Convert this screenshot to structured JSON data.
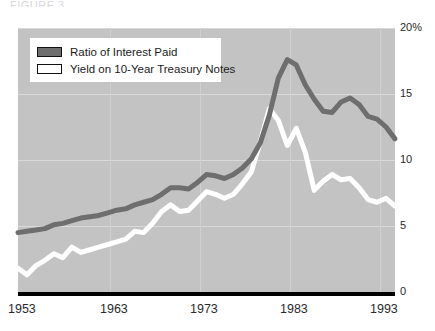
{
  "title_sliver": "FIGURE  3",
  "axis": {
    "y_ticks": [
      {
        "label": "20%",
        "value": 20
      },
      {
        "label": "15",
        "value": 15
      },
      {
        "label": "10",
        "value": 10
      },
      {
        "label": "5",
        "value": 5
      },
      {
        "label": "0",
        "value": 0
      }
    ],
    "x_ticks": [
      {
        "label": "1953",
        "value": 1953
      },
      {
        "label": "1963",
        "value": 1963
      },
      {
        "label": "1973",
        "value": 1973
      },
      {
        "label": "1983",
        "value": 1983
      },
      {
        "label": "1993",
        "value": 1993
      }
    ]
  },
  "legend": {
    "items": [
      {
        "label": "Ratio of Interest Paid",
        "color": "#6e6e6e"
      },
      {
        "label": "Yield on 10-Year Treasury Notes",
        "color": "#ffffff"
      }
    ]
  },
  "colors": {
    "plot_background": "#c3c3c3",
    "gridline": "#d9d9d9",
    "axis": "#000000",
    "series_ratio": "#6e6e6e",
    "series_yield": "#ffffff",
    "text": "#2b2b2b"
  },
  "chart_data": {
    "type": "line",
    "title": "",
    "xlabel": "",
    "ylabel": "",
    "xlim": [
      1953,
      1995
    ],
    "ylim": [
      0,
      20
    ],
    "grid": true,
    "legend_position": "top-left",
    "x": [
      1953,
      1954,
      1955,
      1956,
      1957,
      1958,
      1959,
      1960,
      1961,
      1962,
      1963,
      1964,
      1965,
      1966,
      1967,
      1968,
      1969,
      1970,
      1971,
      1972,
      1973,
      1974,
      1975,
      1976,
      1977,
      1978,
      1979,
      1980,
      1981,
      1982,
      1983,
      1984,
      1985,
      1986,
      1987,
      1988,
      1989,
      1990,
      1991,
      1992,
      1993,
      1994,
      1995
    ],
    "series": [
      {
        "name": "Ratio of Interest Paid",
        "color": "#6e6e6e",
        "values": [
          4.5,
          4.6,
          4.7,
          4.8,
          5.1,
          5.2,
          5.4,
          5.6,
          5.7,
          5.8,
          6.0,
          6.2,
          6.3,
          6.6,
          6.8,
          7.0,
          7.4,
          7.9,
          7.9,
          7.8,
          8.3,
          8.9,
          8.8,
          8.6,
          8.9,
          9.4,
          10.1,
          11.3,
          13.4,
          16.2,
          17.6,
          17.2,
          15.7,
          14.6,
          13.7,
          13.6,
          14.4,
          14.7,
          14.2,
          13.3,
          13.1,
          12.5,
          11.6
        ]
      },
      {
        "name": "Yield on 10-Year Treasury Notes",
        "color": "#ffffff",
        "values": [
          1.8,
          1.3,
          2.0,
          2.4,
          2.9,
          2.6,
          3.4,
          3.0,
          3.2,
          3.4,
          3.6,
          3.8,
          4.0,
          4.6,
          4.5,
          5.2,
          6.1,
          6.6,
          6.1,
          6.2,
          6.9,
          7.6,
          7.4,
          7.1,
          7.4,
          8.2,
          9.1,
          11.4,
          13.9,
          13.0,
          11.1,
          12.4,
          10.6,
          7.7,
          8.4,
          8.9,
          8.5,
          8.6,
          7.9,
          7.0,
          6.8,
          7.1,
          6.5
        ]
      }
    ]
  }
}
